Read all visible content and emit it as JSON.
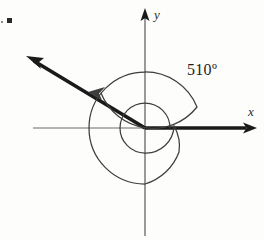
{
  "figure": {
    "kind": "standard-position-angle-diagram",
    "axes": {
      "x_label": "x",
      "y_label": "y",
      "origin": {
        "x": 145,
        "y": 128
      },
      "x_axis_left_end": 33,
      "x_axis_right_end": 255,
      "y_axis_top_end": 10,
      "y_axis_bottom_end": 236
    },
    "angle": {
      "label": "510",
      "degree_symbol": "º",
      "label_full": "510º",
      "measure_degrees": 510,
      "revolutions": 1,
      "remainder_degrees": 150,
      "direction": "counterclockwise",
      "initial_side_degrees": 0,
      "terminal_side_degrees": 150,
      "terminal_quadrant": "II",
      "label_position": {
        "x": 188,
        "y": 74
      }
    },
    "spiral": {
      "inner_arc_radius": 25,
      "outer_arc_radius": 56,
      "arrowhead_tip": {
        "x": 92,
        "y": 88
      }
    },
    "terminal_ray": {
      "tip": {
        "x": 28,
        "y": 57
      },
      "length": 134
    },
    "list_marker": "▪",
    "colors": {
      "ray_stroke": "#1a1a1a",
      "axis_stroke": "#4a4a4a",
      "spiral_stroke": "#3d3d3d",
      "background": "#fdfdfc",
      "text": "#1d1d1d"
    }
  }
}
